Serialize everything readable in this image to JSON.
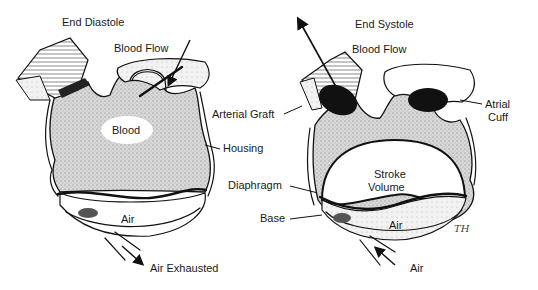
{
  "figure": {
    "panels": [
      {
        "id": "end-diastole",
        "title": "End Diastole",
        "labels": {
          "blood_flow": "Blood Flow",
          "blood": "Blood",
          "air": "Air",
          "air_exhausted": "Air Exhausted"
        }
      },
      {
        "id": "end-systole",
        "title": "End Systole",
        "labels": {
          "blood_flow": "Blood Flow",
          "stroke_volume_line1": "Stroke",
          "stroke_volume_line2": "Volume",
          "air": "Air",
          "air_in": "Air",
          "atrial_cuff_line1": "Atrial",
          "atrial_cuff_line2": "Cuff"
        }
      }
    ],
    "shared_labels": {
      "arterial_graft": "Arterial Graft",
      "housing": "Housing",
      "diaphragm": "Diaphragm",
      "base": "Base"
    },
    "signature": "TH",
    "colors": {
      "ink": "#111111",
      "stipple": "#bdbdbd",
      "valve_dark": "#111111",
      "background": "#ffffff"
    }
  }
}
